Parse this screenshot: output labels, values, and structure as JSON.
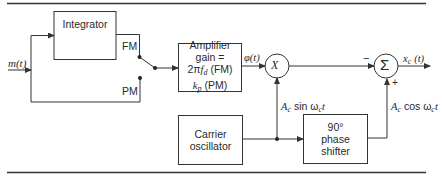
{
  "diagram": {
    "type": "block-diagram",
    "title": "",
    "input": {
      "label": "m(t)"
    },
    "blocks": {
      "integrator": {
        "label": "Integrator"
      },
      "amplifier": {
        "lines": [
          "Amplifier",
          "gain =",
          "2πf_d (FM)",
          "k_p (PM)"
        ]
      },
      "carrier": {
        "lines": [
          "Carrier",
          "oscillator"
        ]
      },
      "phase_shifter": {
        "lines": [
          "90°",
          "phase",
          "shifter"
        ]
      }
    },
    "switch": {
      "fm_label": "FM",
      "pm_label": "PM"
    },
    "nodes": {
      "multiplier": {
        "symbol": "×"
      },
      "summer": {
        "symbol": "Σ",
        "minus_label": "−",
        "plus_label": "+"
      }
    },
    "signals": {
      "phi": "φ(t)",
      "sin_carrier": "A_c sin ω_c t",
      "cos_carrier": "A_c cos ω_c t",
      "output": "x_c(t)"
    },
    "colors": {
      "line": "#333333",
      "background": "#ffffff"
    }
  }
}
